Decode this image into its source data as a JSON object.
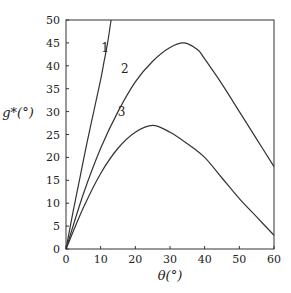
{
  "chart_data": {
    "type": "line",
    "title": "",
    "xlabel": "θ(°)",
    "ylabel": "g*(°)",
    "xlim": [
      0,
      60
    ],
    "ylim": [
      0,
      50
    ],
    "xticks": [
      0,
      10,
      20,
      30,
      40,
      50,
      60
    ],
    "yticks": [
      0,
      5,
      10,
      15,
      20,
      25,
      30,
      35,
      40,
      45,
      50
    ],
    "grid": false,
    "legend": "inline labels 1, 2, 3",
    "series": [
      {
        "name": "1",
        "x": [
          0,
          2,
          4,
          6,
          8,
          10,
          11,
          12,
          13
        ],
        "y": [
          0,
          8,
          15.5,
          23,
          30,
          37,
          41,
          45,
          50
        ]
      },
      {
        "name": "2",
        "x": [
          0,
          5,
          10,
          15,
          20,
          25,
          30,
          34,
          38,
          40,
          45,
          50,
          55,
          60
        ],
        "y": [
          0,
          12,
          22,
          30,
          36.5,
          41,
          44,
          45,
          43.5,
          41.5,
          36,
          30,
          24,
          18
        ]
      },
      {
        "name": "3",
        "x": [
          0,
          5,
          10,
          15,
          20,
          25,
          30,
          35,
          40,
          45,
          50,
          55,
          60
        ],
        "y": [
          0,
          9,
          16.5,
          22,
          25.5,
          27,
          25.5,
          23,
          20,
          15.5,
          11,
          7,
          3
        ]
      }
    ]
  }
}
